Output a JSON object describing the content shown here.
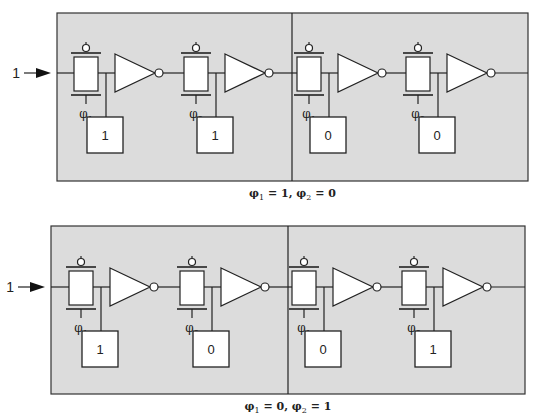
{
  "diagram": {
    "panels": [
      {
        "id": "top",
        "input_label": "1",
        "caption": {
          "phi1_symbol": "φ",
          "phi1_sub": "1",
          "phi1_value": "1",
          "phi2_symbol": "φ",
          "phi2_sub": "2",
          "phi2_value": "0",
          "sep": ", "
        },
        "stages": [
          {
            "clock_symbol": "φ",
            "clock_sub": "1",
            "stored_value": "1"
          },
          {
            "clock_symbol": "φ",
            "clock_sub": "2",
            "stored_value": "1"
          },
          {
            "clock_symbol": "φ",
            "clock_sub": "1",
            "stored_value": "0"
          },
          {
            "clock_symbol": "φ",
            "clock_sub": "2",
            "stored_value": "0"
          }
        ]
      },
      {
        "id": "bottom",
        "input_label": "1",
        "caption": {
          "phi1_symbol": "φ",
          "phi1_sub": "1",
          "phi1_value": "0",
          "phi2_symbol": "φ",
          "phi2_sub": "2",
          "phi2_value": "1",
          "sep": ", "
        },
        "stages": [
          {
            "clock_symbol": "φ",
            "clock_sub": "1",
            "stored_value": "1"
          },
          {
            "clock_symbol": "φ",
            "clock_sub": "2",
            "stored_value": "0"
          },
          {
            "clock_symbol": "φ",
            "clock_sub": "1",
            "stored_value": "0"
          },
          {
            "clock_symbol": "φ",
            "clock_sub": "2",
            "stored_value": "1"
          }
        ]
      }
    ],
    "colors": {
      "panel_fill": "#dcdcdc",
      "line": "#222222",
      "background": "#ffffff"
    }
  }
}
